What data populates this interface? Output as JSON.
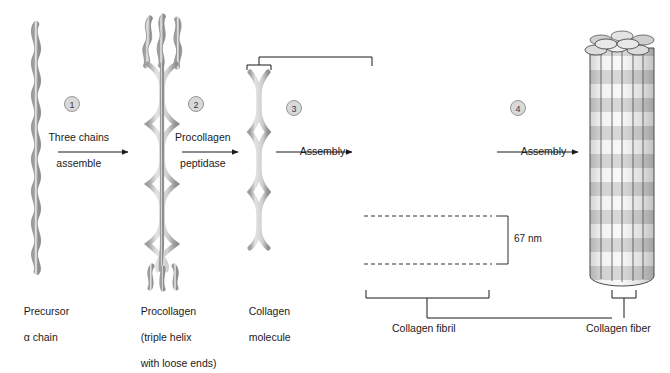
{
  "figure": {
    "background": "#ffffff",
    "ink": "#1a1a1a",
    "strand_fill": "#d9d9d9",
    "strand_stroke": "#7a7a7a",
    "rod_fill": "#9a9a9a",
    "badge_fill": "#d9d9d9",
    "badge_stroke": "#8c8c8c",
    "band_light": "#f2f2f2",
    "band_dark": "#a8a8a8"
  },
  "steps": [
    {
      "number": "1",
      "label_line1": "Three chains",
      "label_line2": "assemble"
    },
    {
      "number": "2",
      "label_line1": "Procollagen",
      "label_line2": "peptidase"
    },
    {
      "number": "3",
      "label_line1": "Assembly",
      "label_line2": ""
    },
    {
      "number": "4",
      "label_line1": "Assembly",
      "label_line2": ""
    }
  ],
  "structures": [
    {
      "name": "precursor-alpha-chain",
      "caption_line1": "Precursor",
      "caption_line2": "α chain",
      "caption_line3": ""
    },
    {
      "name": "procollagen",
      "caption_line1": "Procollagen",
      "caption_line2": "(triple helix",
      "caption_line3": "with loose ends)"
    },
    {
      "name": "collagen-molecule",
      "caption_line1": "Collagen",
      "caption_line2": "molecule",
      "caption_line3": ""
    },
    {
      "name": "collagen-fibril",
      "caption_line1": "Collagen fibril",
      "caption_line2": "",
      "caption_line3": ""
    },
    {
      "name": "collagen-fiber",
      "caption_line1": "Collagen fiber",
      "caption_line2": "",
      "caption_line3": ""
    }
  ],
  "annotations": {
    "banding_period": "67 nm"
  }
}
